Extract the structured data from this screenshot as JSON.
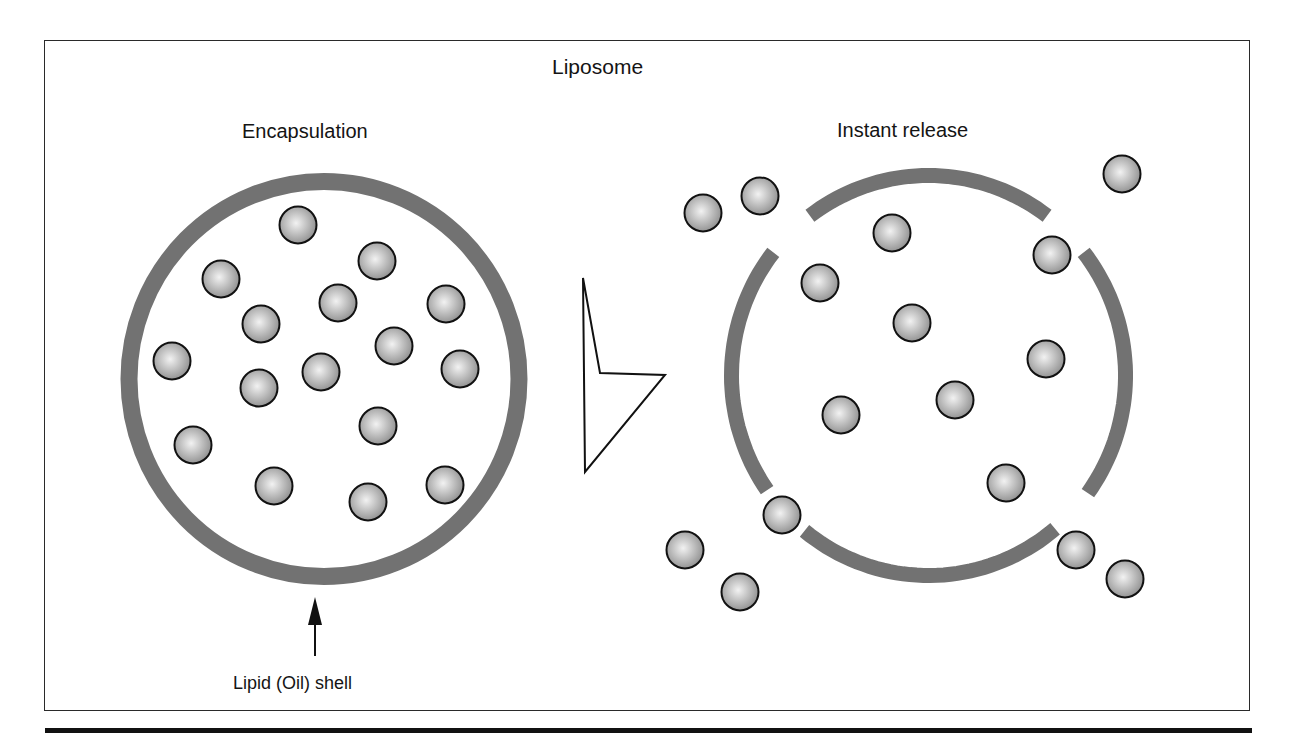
{
  "title": "Liposome",
  "panels": {
    "left": {
      "label": "Encapsulation",
      "shell": {
        "cx": 324,
        "cy": 379,
        "rx": 195,
        "ry": 197.5,
        "stroke_width": 17
      },
      "particles": [
        [
          298,
          225
        ],
        [
          377,
          261
        ],
        [
          221,
          279
        ],
        [
          338,
          303
        ],
        [
          446,
          304
        ],
        [
          261,
          324
        ],
        [
          394,
          346
        ],
        [
          172,
          361
        ],
        [
          321,
          372
        ],
        [
          460,
          369
        ],
        [
          259,
          388
        ],
        [
          378,
          426
        ],
        [
          193,
          445
        ],
        [
          274,
          486
        ],
        [
          368,
          502
        ],
        [
          445,
          485
        ]
      ],
      "annotation": {
        "label": "Lipid (Oil) shell",
        "arrow": {
          "x": 315,
          "tip_y": 597,
          "head_base_y": 625,
          "tail_y": 656
        }
      }
    },
    "transition_arrow": {
      "points": [
        [
          583,
          278
        ],
        [
          600,
          373
        ],
        [
          665,
          375
        ],
        [
          585,
          472
        ]
      ]
    },
    "right": {
      "label": "Instant release",
      "shell": {
        "cx": 928.5,
        "cy": 375.5,
        "rx": 197,
        "ry": 200,
        "stroke_width": 15
      },
      "arc_segments_deg": [
        {
          "name": "top",
          "start": 233,
          "end": 307
        },
        {
          "name": "right",
          "start": -38,
          "end": 36
        },
        {
          "name": "bottom",
          "start": 50,
          "end": 129
        },
        {
          "name": "left",
          "start": 145,
          "end": 218
        }
      ],
      "particles_inside": [
        [
          892,
          233
        ],
        [
          820,
          283
        ],
        [
          1052,
          255
        ],
        [
          912,
          323
        ],
        [
          1046,
          359
        ],
        [
          841,
          415
        ],
        [
          955,
          400
        ],
        [
          1006,
          483
        ]
      ],
      "particles_outside": [
        [
          703,
          213
        ],
        [
          760,
          196
        ],
        [
          1122,
          174
        ],
        [
          782,
          515
        ],
        [
          685,
          550
        ],
        [
          740,
          592
        ],
        [
          1076,
          550
        ],
        [
          1125,
          579
        ]
      ]
    }
  },
  "style": {
    "shell_color": "#727272",
    "particle_stroke": "#111111",
    "particle_light": "#f2f2f2",
    "particle_dark": "#8c8c8c",
    "particle_radius": 18.5
  }
}
